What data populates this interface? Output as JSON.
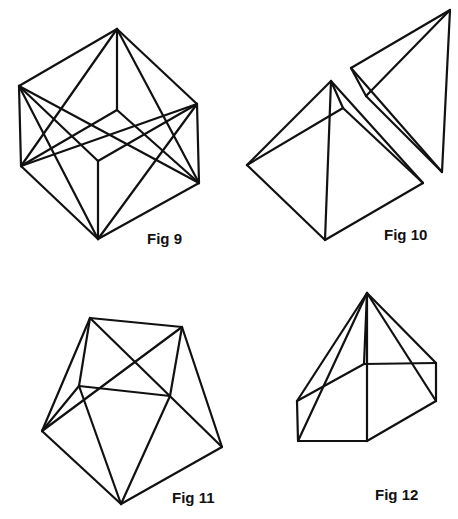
{
  "figures": [
    {
      "id": "fig9",
      "label": "Fig 9",
      "description": "Cube with face diagonals",
      "label_pos": [
        147,
        244
      ],
      "edges": [
        [
          [
            117,
            29
          ],
          [
            19,
            86
          ]
        ],
        [
          [
            117,
            29
          ],
          [
            197,
            104
          ]
        ],
        [
          [
            117,
            29
          ],
          [
            117,
            110
          ]
        ],
        [
          [
            19,
            86
          ],
          [
            21,
            166
          ]
        ],
        [
          [
            197,
            104
          ],
          [
            199,
            183
          ]
        ],
        [
          [
            117,
            110
          ],
          [
            21,
            166
          ]
        ],
        [
          [
            117,
            110
          ],
          [
            199,
            183
          ]
        ],
        [
          [
            19,
            86
          ],
          [
            98,
            161
          ]
        ],
        [
          [
            197,
            104
          ],
          [
            98,
            161
          ]
        ],
        [
          [
            98,
            161
          ],
          [
            98,
            239
          ]
        ],
        [
          [
            21,
            166
          ],
          [
            98,
            239
          ]
        ],
        [
          [
            199,
            183
          ],
          [
            98,
            239
          ]
        ],
        [
          [
            117,
            29
          ],
          [
            21,
            166
          ]
        ],
        [
          [
            117,
            29
          ],
          [
            199,
            183
          ]
        ],
        [
          [
            19,
            86
          ],
          [
            98,
            239
          ]
        ],
        [
          [
            197,
            104
          ],
          [
            98,
            239
          ]
        ],
        [
          [
            19,
            86
          ],
          [
            199,
            183
          ]
        ],
        [
          [
            197,
            104
          ],
          [
            21,
            166
          ]
        ]
      ]
    },
    {
      "id": "fig10",
      "label": "Fig 10",
      "description": "Square pyramid and separated tetrahedron",
      "label_pos": [
        384,
        240
      ],
      "edges": [
        [
          [
            331,
            81
          ],
          [
            247,
            165
          ]
        ],
        [
          [
            331,
            81
          ],
          [
            325,
            240
          ]
        ],
        [
          [
            331,
            81
          ],
          [
            343,
            108
          ]
        ],
        [
          [
            331,
            81
          ],
          [
            423,
            183
          ]
        ],
        [
          [
            247,
            165
          ],
          [
            325,
            240
          ]
        ],
        [
          [
            325,
            240
          ],
          [
            423,
            183
          ]
        ],
        [
          [
            247,
            165
          ],
          [
            343,
            108
          ]
        ],
        [
          [
            343,
            108
          ],
          [
            423,
            183
          ]
        ],
        [
          [
            450,
            10
          ],
          [
            351,
            68
          ]
        ],
        [
          [
            450,
            10
          ],
          [
            366,
            96
          ]
        ],
        [
          [
            450,
            10
          ],
          [
            442,
            172
          ]
        ],
        [
          [
            351,
            68
          ],
          [
            366,
            96
          ]
        ],
        [
          [
            351,
            68
          ],
          [
            442,
            172
          ]
        ],
        [
          [
            366,
            96
          ],
          [
            442,
            172
          ]
        ]
      ]
    },
    {
      "id": "fig11",
      "label": "Fig 11",
      "description": "Polyhedron formed by a square with attached triangles",
      "label_pos": [
        172,
        503
      ],
      "edges": [
        [
          [
            90,
            318
          ],
          [
            182,
            327
          ]
        ],
        [
          [
            90,
            318
          ],
          [
            79,
            386
          ]
        ],
        [
          [
            90,
            318
          ],
          [
            42,
            431
          ]
        ],
        [
          [
            90,
            318
          ],
          [
            222,
            447
          ]
        ],
        [
          [
            182,
            327
          ],
          [
            170,
            396
          ]
        ],
        [
          [
            182,
            327
          ],
          [
            222,
            447
          ]
        ],
        [
          [
            182,
            327
          ],
          [
            42,
            431
          ]
        ],
        [
          [
            79,
            386
          ],
          [
            170,
            396
          ]
        ],
        [
          [
            79,
            386
          ],
          [
            42,
            431
          ]
        ],
        [
          [
            79,
            386
          ],
          [
            121,
            504
          ]
        ],
        [
          [
            170,
            396
          ],
          [
            121,
            504
          ]
        ],
        [
          [
            42,
            431
          ],
          [
            121,
            504
          ]
        ],
        [
          [
            222,
            447
          ],
          [
            121,
            504
          ]
        ]
      ]
    },
    {
      "id": "fig12",
      "label": "Fig 12",
      "description": "Pyramid on a prism base",
      "label_pos": [
        375,
        500
      ],
      "edges": [
        [
          [
            367,
            293
          ],
          [
            297,
            401
          ]
        ],
        [
          [
            367,
            293
          ],
          [
            298,
            441
          ]
        ],
        [
          [
            367,
            293
          ],
          [
            364,
            364
          ]
        ],
        [
          [
            367,
            293
          ],
          [
            367,
            441
          ]
        ],
        [
          [
            367,
            293
          ],
          [
            436,
            363
          ]
        ],
        [
          [
            367,
            293
          ],
          [
            436,
            401
          ]
        ],
        [
          [
            297,
            401
          ],
          [
            364,
            364
          ]
        ],
        [
          [
            364,
            364
          ],
          [
            436,
            363
          ]
        ],
        [
          [
            297,
            401
          ],
          [
            298,
            441
          ]
        ],
        [
          [
            436,
            363
          ],
          [
            436,
            401
          ]
        ],
        [
          [
            298,
            441
          ],
          [
            367,
            441
          ]
        ],
        [
          [
            367,
            441
          ],
          [
            436,
            401
          ]
        ]
      ]
    }
  ],
  "style": {
    "stroke_color": "#111111",
    "background": "#ffffff"
  }
}
